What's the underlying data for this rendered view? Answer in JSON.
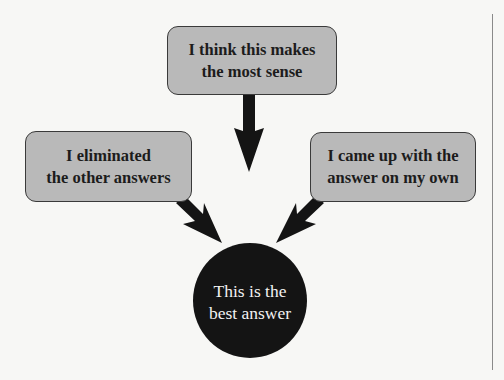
{
  "diagram": {
    "nodes": {
      "top": {
        "line1": "I think this makes",
        "line2": "the most sense"
      },
      "left": {
        "line1": "I eliminated",
        "line2": "the other answers"
      },
      "right": {
        "line1": "I came up with the",
        "line2": "answer on my own"
      },
      "center": {
        "line1": "This is the",
        "line2": "best answer"
      }
    },
    "edges": [
      {
        "from": "top",
        "to": "center"
      },
      {
        "from": "left",
        "to": "center"
      },
      {
        "from": "right",
        "to": "center"
      }
    ],
    "colors": {
      "box_fill": "#b9b9b9",
      "box_border": "#3a3a3a",
      "arrow": "#141414",
      "circle_fill": "#141414",
      "circle_text": "#f2f2f2",
      "background": "#f7f7f5"
    }
  }
}
